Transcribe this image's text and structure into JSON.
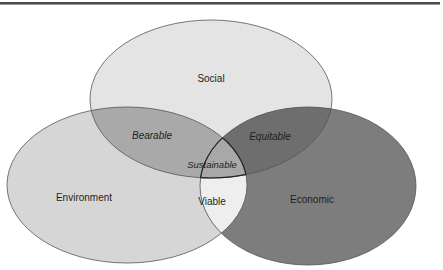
{
  "diagram": {
    "type": "venn",
    "sets": [
      {
        "id": "social",
        "label": "Social",
        "fill": "#e4e4e4"
      },
      {
        "id": "environment",
        "label": "Environment",
        "fill": "#d6d6d6"
      },
      {
        "id": "economic",
        "label": "Economic",
        "fill": "#7d7d7d"
      }
    ],
    "intersections": [
      {
        "sets": [
          "social",
          "environment"
        ],
        "label": "Bearable",
        "fill": "#a9a9a9"
      },
      {
        "sets": [
          "social",
          "economic"
        ],
        "label": "Equitable",
        "fill": "#6e6e6e"
      },
      {
        "sets": [
          "environment",
          "economic"
        ],
        "label": "Viable",
        "fill": "#eeeeee"
      },
      {
        "sets": [
          "social",
          "environment",
          "economic"
        ],
        "label": "Sustainable",
        "fill": "#a8a8a8"
      }
    ],
    "outline_color": "#3a3a3a"
  }
}
